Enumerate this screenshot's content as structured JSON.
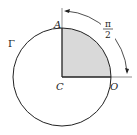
{
  "diagram": {
    "type": "geometry",
    "labels": {
      "center": "C",
      "top_point": "A",
      "right_point": "O",
      "circle": "Γ",
      "angle_numerator": "π",
      "angle_denominator": "2"
    },
    "colors": {
      "stroke": "#222222",
      "sector_fill": "#d9d9d9",
      "background": "#ffffff"
    }
  }
}
